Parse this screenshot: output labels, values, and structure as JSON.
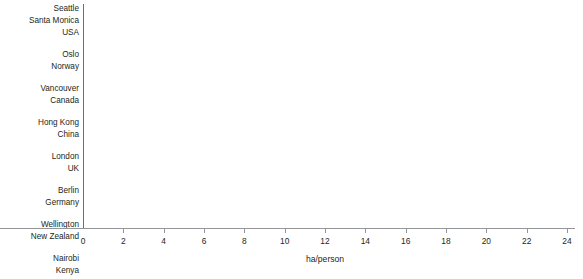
{
  "chart_data": {
    "type": "bar",
    "orientation": "horizontal",
    "title": "",
    "subtitle": "",
    "xlabel": "ha/person",
    "ylabel": "",
    "xlim": [
      0,
      24
    ],
    "xticks": [
      0,
      2,
      4,
      6,
      8,
      10,
      12,
      14,
      16,
      18,
      20,
      22,
      24
    ],
    "xtick_labels": [
      "0",
      "2",
      "4",
      "6",
      "8",
      "10",
      "12",
      "14",
      "16",
      "18",
      "20",
      "22",
      "24"
    ],
    "grid": false,
    "legend": "none",
    "categories": [
      "Seattle",
      "Santa Monica",
      "USA",
      "Oslo",
      "Norway",
      "Vancouver",
      "Canada",
      "Hong Kong",
      "China",
      "London",
      "UK",
      "Berlin",
      "Germany",
      "Wellington",
      "New Zealand",
      "Nairobi",
      "Kenya"
    ],
    "values": [
      22.2,
      20.9,
      9.5,
      7.6,
      5.7,
      7.6,
      7.5,
      7.0,
      1.6,
      6.5,
      5.5,
      4.0,
      4.4,
      2.4,
      5.9,
      0.9,
      0.8
    ],
    "bar_colors": [
      "#6d6e71",
      "#6d6e71",
      "#0d0d0d",
      "#6d6e71",
      "#0d0d0d",
      "#6d6e71",
      "#0d0d0d",
      "#6d6e71",
      "#0d0d0d",
      "#6d6e71",
      "#0d0d0d",
      "#6d6e71",
      "#0d0d0d",
      "#6d6e71",
      "#0d0d0d",
      "#6d6e71",
      "#0d0d0d"
    ],
    "series": [
      {
        "name": "city",
        "color": "#6d6e71"
      },
      {
        "name": "country",
        "color": "#0d0d0d"
      }
    ],
    "groups": [
      {
        "labels": [
          "Seattle",
          "Santa Monica",
          "USA"
        ],
        "values": [
          22.2,
          20.9,
          9.5
        ]
      },
      {
        "labels": [
          "Oslo",
          "Norway"
        ],
        "values": [
          7.6,
          5.7
        ]
      },
      {
        "labels": [
          "Vancouver",
          "Canada"
        ],
        "values": [
          7.6,
          7.5
        ]
      },
      {
        "labels": [
          "Hong Kong",
          "China"
        ],
        "values": [
          7.0,
          1.6
        ]
      },
      {
        "labels": [
          "London",
          "UK"
        ],
        "values": [
          6.5,
          5.5
        ]
      },
      {
        "labels": [
          "Berlin",
          "Germany"
        ],
        "values": [
          4.0,
          4.4
        ]
      },
      {
        "labels": [
          "Wellington",
          "New Zealand"
        ],
        "values": [
          2.4,
          5.9
        ]
      },
      {
        "labels": [
          "Nairobi",
          "Kenya"
        ],
        "values": [
          0.9,
          0.8
        ]
      }
    ]
  },
  "axis": {
    "x_title": "ha/person"
  },
  "colors": {
    "city_bar": "#6d6e71",
    "country_bar": "#0d0d0d",
    "axis": "#939598",
    "text": "#231f20",
    "background": "#ffffff"
  }
}
